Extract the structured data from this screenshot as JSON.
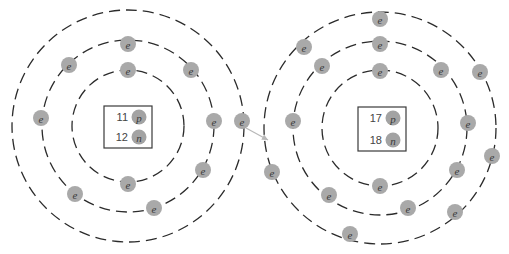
{
  "diagram": {
    "type": "bohr-model-electron-transfer",
    "colors": {
      "electron": "#a9a9a9",
      "ring": "#2b2b2b",
      "arrow": "#b8b8b8",
      "box": "#3a3a3a"
    },
    "electron_label": "e",
    "atoms": [
      {
        "name": "left-atom",
        "center": [
          128,
          126
        ],
        "ring_radii": [
          56,
          86,
          116
        ],
        "nucleus": {
          "box": [
            104,
            106,
            48,
            42
          ],
          "protons": {
            "count": "11",
            "symbol": "p"
          },
          "neutrons": {
            "count": "12",
            "symbol": "n"
          }
        },
        "shells": [
          {
            "electron_count": 2,
            "electrons": [
              [
                128,
                70
              ],
              [
                128,
                184
              ]
            ]
          },
          {
            "electron_count": 8,
            "electrons": [
              [
                128,
                44
              ],
              [
                69,
                65
              ],
              [
                41,
                118
              ],
              [
                191,
                70
              ],
              [
                214,
                121
              ],
              [
                203,
                170
              ],
              [
                75,
                194
              ],
              [
                154,
                208
              ]
            ]
          },
          {
            "electron_count": 1,
            "electrons": [
              [
                242,
                121
              ]
            ]
          }
        ]
      },
      {
        "name": "right-atom",
        "center": [
          380,
          128
        ],
        "ring_radii": [
          58,
          87,
          116
        ],
        "nucleus": {
          "box": [
            358,
            107,
            48,
            44
          ],
          "protons": {
            "count": "17",
            "symbol": "p"
          },
          "neutrons": {
            "count": "18",
            "symbol": "n"
          }
        },
        "shells": [
          {
            "electron_count": 2,
            "electrons": [
              [
                380,
                71
              ],
              [
                380,
                186
              ]
            ]
          },
          {
            "electron_count": 8,
            "electrons": [
              [
                380,
                44
              ],
              [
                322,
                66
              ],
              [
                293,
                121
              ],
              [
                441,
                70
              ],
              [
                468,
                123
              ],
              [
                457,
                170
              ],
              [
                329,
                195
              ],
              [
                408,
                208
              ]
            ]
          },
          {
            "electron_count": 7,
            "electrons": [
              [
                380,
                19
              ],
              [
                304,
                47
              ],
              [
                480,
                72
              ],
              [
                492,
                156
              ],
              [
                455,
                212
              ],
              [
                350,
                234
              ],
              [
                272,
                172
              ]
            ]
          }
        ]
      }
    ],
    "transfer_arrow": {
      "from": [
        246,
        128
      ],
      "to": [
        268,
        140
      ]
    }
  }
}
